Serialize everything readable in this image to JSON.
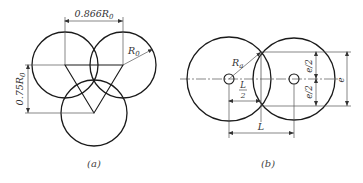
{
  "panel_a": {
    "caption": "(a)",
    "dim_horizontal": "0.866R",
    "dim_horizontal_sub": "0",
    "dim_vertical": "0.75R",
    "dim_vertical_sub": "0",
    "radius_label": "R",
    "radius_sub": "0"
  },
  "panel_b": {
    "caption": "(b)",
    "radius_label": "R",
    "radius_sub": "a",
    "half_L_num": "L",
    "half_L_den": "2",
    "L_label": "L",
    "e_half_top": "e/2",
    "e_half_bottom": "e/2",
    "e_label": "e"
  },
  "colors": {
    "stroke": "#1a1a1a",
    "thin": "#555555"
  }
}
